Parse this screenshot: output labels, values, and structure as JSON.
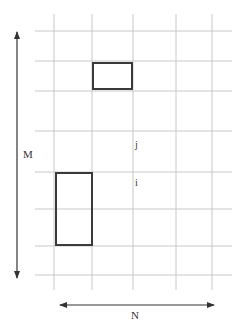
{
  "diagram": {
    "colors": {
      "background": "#ffffff",
      "grid": "#c8c8c8",
      "rect_stroke": "#3a3a3a",
      "arrow": "#333333",
      "text": "#333333"
    },
    "grid": {
      "vertical_lines_x": [
        54,
        92,
        133,
        176,
        212
      ],
      "vertical_y_range": [
        14,
        290
      ],
      "horizontal_lines_y": [
        31,
        61,
        91,
        131,
        172,
        209,
        246,
        275
      ],
      "horizontal_x_range": [
        35,
        232
      ]
    },
    "rectangles": [
      {
        "name": "top-rectangle",
        "x": 93,
        "y": 63,
        "width": 39,
        "height": 26
      },
      {
        "name": "bottom-rectangle",
        "x": 56,
        "y": 173,
        "width": 36,
        "height": 72
      }
    ],
    "arrows": {
      "m_axis": {
        "x": 17,
        "y1": 32,
        "y2": 278,
        "label": "M",
        "direction": "both-vertical"
      },
      "n_axis": {
        "y": 305,
        "x1": 60,
        "x2": 214,
        "label": "N",
        "direction": "both-horizontal"
      }
    },
    "labels": {
      "m": "M",
      "n": "N",
      "j": "j",
      "i": "i"
    }
  }
}
